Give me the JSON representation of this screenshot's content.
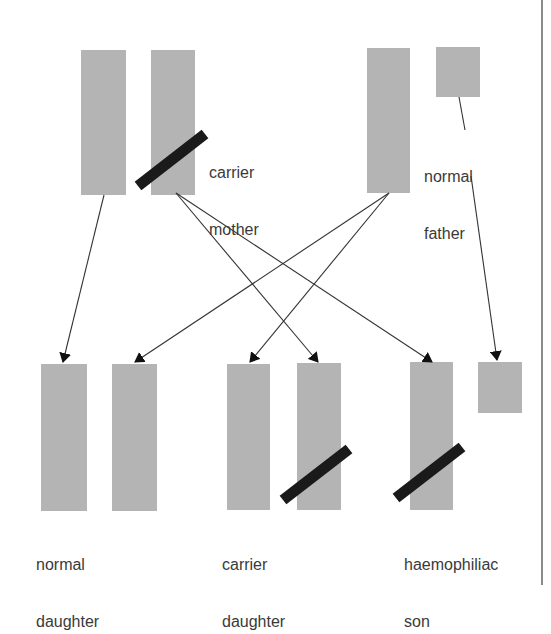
{
  "diagram": {
    "title": "",
    "parents": {
      "mother": {
        "label_line1": "carrier",
        "label_line2": "mother"
      },
      "father": {
        "label_line1": "normal",
        "label_line2": "father"
      }
    },
    "children": {
      "normal_daughter": {
        "label_line1": "normal",
        "label_line2": "daughter"
      },
      "carrier_daughter": {
        "label_line1": "carrier",
        "label_line2": "daughter"
      },
      "haemophiliac_son": {
        "label_line1": "haemophiliac",
        "label_line2": "son"
      }
    },
    "colors": {
      "chromosome": "#b4b4b4",
      "gene_bar": "#1a1a1a",
      "arrow": "#333333"
    }
  }
}
